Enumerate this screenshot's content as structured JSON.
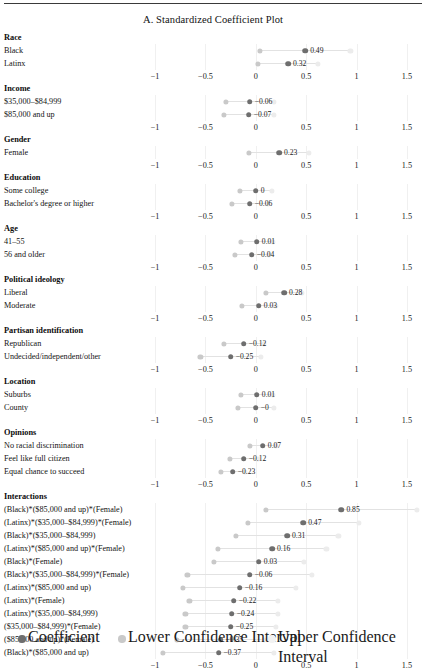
{
  "figure": {
    "title": "A. Standardized Coefficient Plot"
  },
  "axis": {
    "ticks": [
      "−1",
      "−0.5",
      "0",
      "0.5",
      "1",
      "1.5"
    ],
    "tick_values": [
      -1,
      -0.5,
      0,
      0.5,
      1,
      1.5
    ]
  },
  "legend": {
    "items": [
      {
        "label": "Coefficient",
        "color": "#6e6e6e"
      },
      {
        "label": "Lower Confidence Interval",
        "color": "#c9c9c9"
      },
      {
        "label": "Upper Confidence Interval",
        "color": "#f2f2f2"
      }
    ]
  },
  "chart_data": {
    "type": "scatter",
    "title": "A. Standardized Coefficient Plot",
    "xlabel": "",
    "ylabel": "",
    "xlim": [
      -1.15,
      1.65
    ],
    "grid": true,
    "legend_position": "bottom",
    "xticks": [
      -1,
      -0.5,
      0,
      0.5,
      1,
      1.5
    ],
    "xticklabels": [
      "−1",
      "−0.5",
      "0",
      "0.5",
      "1",
      "1.5"
    ],
    "series": [
      {
        "name": "Coefficient",
        "color": "#6e6e6e"
      },
      {
        "name": "Lower Confidence Interval",
        "color": "#c9c9c9"
      },
      {
        "name": "Upper Confidence Interval",
        "color": "#f2f2f2"
      }
    ],
    "groups": [
      {
        "group": "Race",
        "rows": [
          {
            "label": "Black",
            "coef": 0.49,
            "coef_text": "0.49",
            "lo": 0.04,
            "hi": 0.94
          },
          {
            "label": "Latinx",
            "coef": 0.32,
            "coef_text": "0.32",
            "lo": 0.02,
            "hi": 0.62
          }
        ]
      },
      {
        "group": "Income",
        "rows": [
          {
            "label": "$35,000–$84,999",
            "coef": -0.06,
            "coef_text": "−0.06",
            "lo": -0.3,
            "hi": 0.18
          },
          {
            "label": "$85,000 and up",
            "coef": -0.07,
            "coef_text": "−0.07",
            "lo": -0.32,
            "hi": 0.18
          }
        ]
      },
      {
        "group": "Gender",
        "rows": [
          {
            "label": "Female",
            "coef": 0.23,
            "coef_text": "0.23",
            "lo": -0.07,
            "hi": 0.53
          }
        ]
      },
      {
        "group": "Education",
        "rows": [
          {
            "label": "Some college",
            "coef": 0.0,
            "coef_text": "0",
            "lo": -0.16,
            "hi": 0.16
          },
          {
            "label": "Bachelor's degree or higher",
            "coef": -0.06,
            "coef_text": "−0.06",
            "lo": -0.24,
            "hi": 0.12
          }
        ]
      },
      {
        "group": "Age",
        "rows": [
          {
            "label": "41–55",
            "coef": 0.01,
            "coef_text": "0.01",
            "lo": -0.15,
            "hi": 0.17
          },
          {
            "label": "56 and older",
            "coef": -0.04,
            "coef_text": "−0.04",
            "lo": -0.21,
            "hi": 0.13
          }
        ]
      },
      {
        "group": "Political ideology",
        "rows": [
          {
            "label": "Liberal",
            "coef": 0.28,
            "coef_text": "0.28",
            "lo": 0.1,
            "hi": 0.46
          },
          {
            "label": "Moderate",
            "coef": 0.03,
            "coef_text": "0.03",
            "lo": -0.14,
            "hi": 0.2
          }
        ]
      },
      {
        "group": "Partisan identification",
        "rows": [
          {
            "label": "Republican",
            "coef": -0.12,
            "coef_text": "−0.12",
            "lo": -0.32,
            "hi": 0.08
          },
          {
            "label": "Undecided/independent/other",
            "coef": -0.25,
            "coef_text": "−0.25",
            "lo": -0.55,
            "hi": 0.05
          }
        ]
      },
      {
        "group": "Location",
        "rows": [
          {
            "label": "Suburbs",
            "coef": 0.01,
            "coef_text": "0.01",
            "lo": -0.15,
            "hi": 0.17
          },
          {
            "label": "County",
            "coef": 0.0,
            "coef_text": "−0",
            "lo": -0.18,
            "hi": 0.18
          }
        ]
      },
      {
        "group": "Opinions",
        "rows": [
          {
            "label": "No racial discrimination",
            "coef": 0.07,
            "coef_text": "0.07",
            "lo": -0.06,
            "hi": 0.2
          },
          {
            "label": "Feel like full citizen",
            "coef": -0.12,
            "coef_text": "−0.12",
            "lo": -0.26,
            "hi": 0.02
          },
          {
            "label": "Equal chance to succeed",
            "coef": -0.23,
            "coef_text": "−0.23",
            "lo": -0.35,
            "hi": -0.11
          }
        ]
      },
      {
        "group": "Interactions",
        "rows": [
          {
            "label": "(Black)*($85,000 and up)*(Female)",
            "coef": 0.85,
            "coef_text": "0.85",
            "lo": 0.1,
            "hi": 1.6
          },
          {
            "label": "(Latinx)*($35,000–$84,999)*(Female)",
            "coef": 0.47,
            "coef_text": "0.47",
            "lo": -0.08,
            "hi": 1.02
          },
          {
            "label": "(Black)*($35,000–$84,999)",
            "coef": 0.31,
            "coef_text": "0.31",
            "lo": -0.2,
            "hi": 0.82
          },
          {
            "label": "(Latinx)*($85,000 and up)*(Female)",
            "coef": 0.16,
            "coef_text": "0.16",
            "lo": -0.38,
            "hi": 0.7
          },
          {
            "label": "(Black)*(Female)",
            "coef": 0.03,
            "coef_text": "0.03",
            "lo": -0.42,
            "hi": 0.48
          },
          {
            "label": "(Black)*($35,000–$84,999)*(Female)",
            "coef": -0.06,
            "coef_text": "−0.06",
            "lo": -0.68,
            "hi": 0.56
          },
          {
            "label": "(Latinx)*($85,000 and up)",
            "coef": -0.16,
            "coef_text": "−0.16",
            "lo": -0.72,
            "hi": 0.4
          },
          {
            "label": "(Latinx)*(Female)",
            "coef": -0.22,
            "coef_text": "−0.22",
            "lo": -0.66,
            "hi": 0.22
          },
          {
            "label": "(Latinx)*($35,000–$84,999)",
            "coef": -0.24,
            "coef_text": "−0.24",
            "lo": -0.7,
            "hi": 0.22
          },
          {
            "label": "($35,000–$84,999)*(Female)",
            "coef": -0.25,
            "coef_text": "−0.25",
            "lo": -0.7,
            "hi": 0.2
          },
          {
            "label": "($85,000 and up)*(Female)",
            "coef": -0.35,
            "coef_text": "−0.35",
            "lo": -0.78,
            "hi": 0.08
          },
          {
            "label": "(Black)*($85,000 and up)",
            "coef": -0.37,
            "coef_text": "−0.37",
            "lo": -0.92,
            "hi": 0.18
          }
        ]
      }
    ]
  }
}
